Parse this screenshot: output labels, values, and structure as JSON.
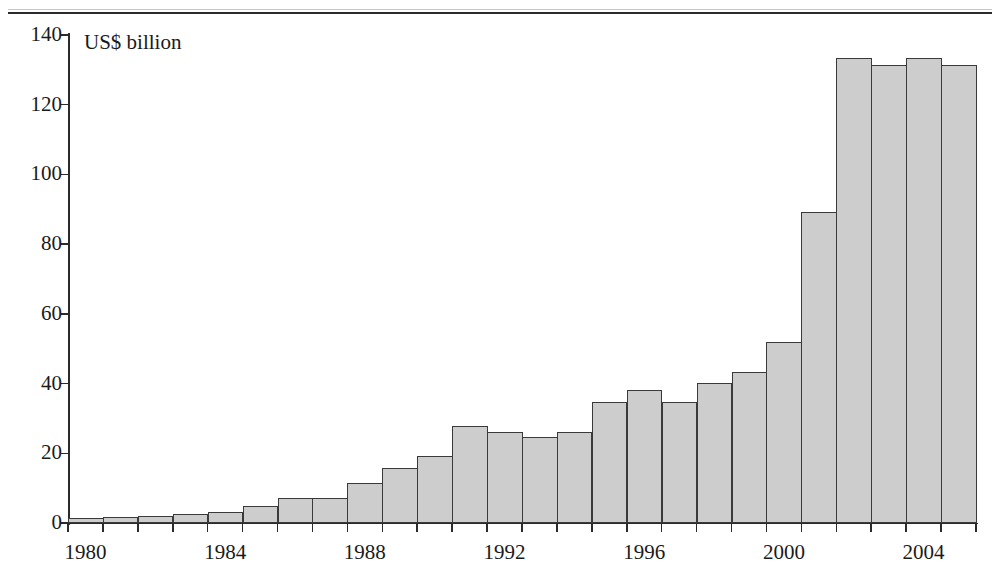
{
  "figure": {
    "unit_label": "US$ billion",
    "plot_bg": "#ffffff",
    "bar_fill": "#cdcdcd",
    "bar_stroke": "#3a3a3a",
    "axis_color": "#2b2b2b"
  },
  "chart_data": {
    "type": "bar",
    "title": "",
    "subtitle": "",
    "xlabel": "",
    "ylabel": "US$ billion",
    "annotations": [
      "US$ billion"
    ],
    "grid": false,
    "legend": null,
    "legend_position": "none",
    "ylim": [
      0,
      140
    ],
    "yticks": [
      0,
      20,
      40,
      60,
      80,
      100,
      120,
      140
    ],
    "ytick_labels": [
      "0",
      "20",
      "40",
      "60",
      "80",
      "100",
      "120",
      "140"
    ],
    "xtick_labels": [
      "1980",
      "1984",
      "1988",
      "1992",
      "1996",
      "2000",
      "2004"
    ],
    "xlim": [
      1980,
      2006
    ],
    "categories": [
      "1980",
      "1981",
      "1982",
      "1983",
      "1984",
      "1985",
      "1986",
      "1987",
      "1988",
      "1989",
      "1990",
      "1991",
      "1992",
      "1993",
      "1994",
      "1995",
      "1996",
      "1997",
      "1998",
      "1999",
      "2000",
      "2001",
      "2002",
      "2003",
      "2004",
      "2005"
    ],
    "values": [
      1.4,
      1.6,
      1.9,
      2.6,
      3.2,
      5.0,
      7.2,
      7.3,
      11.4,
      15.8,
      19.3,
      27.8,
      26.1,
      24.6,
      26.0,
      34.8,
      38.1,
      34.7,
      40.2,
      43.4,
      52.0,
      89.3,
      133.4,
      131.5,
      133.4,
      131.5
    ]
  }
}
